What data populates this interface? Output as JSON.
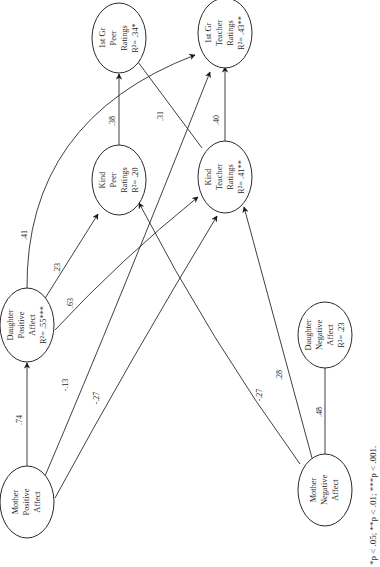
{
  "diagram": {
    "type": "path-model",
    "orientation": "rotated-90-ccw",
    "nodes": [
      {
        "id": "mpa",
        "lines": [
          "Mother",
          "Positive",
          "Affect"
        ],
        "r2": ""
      },
      {
        "id": "dpa",
        "lines": [
          "Daughter",
          "Positive",
          "Affect",
          "R²= .55***"
        ]
      },
      {
        "id": "kpr",
        "lines": [
          "Kind",
          "Peer",
          "Ratings",
          "R²= .20"
        ]
      },
      {
        "id": "ktr",
        "lines": [
          "Kind",
          "Teacher",
          "Ratings",
          "R²= .41**"
        ]
      },
      {
        "id": "gpr",
        "lines": [
          "1st Gr",
          "Peer",
          "Ratings",
          "R²= .34*"
        ]
      },
      {
        "id": "gtr",
        "lines": [
          "1st Gr",
          "Teacher",
          "Ratings",
          "R²= .43**"
        ]
      },
      {
        "id": "mna",
        "lines": [
          "Mother",
          "Negative",
          "Affect"
        ]
      },
      {
        "id": "dna",
        "lines": [
          "Daughter",
          "Negative",
          "Affect",
          "R²= .23"
        ]
      }
    ],
    "edges": [
      {
        "from": "mpa",
        "to": "dpa",
        "coef": ".74"
      },
      {
        "from": "mpa",
        "to": "gtr",
        "coef": "-.13"
      },
      {
        "from": "mpa",
        "to": "ktr",
        "coef": "-.27"
      },
      {
        "from": "dpa",
        "to": "gtr",
        "coef": ".41"
      },
      {
        "from": "dpa",
        "to": "kpr",
        "coef": ".23"
      },
      {
        "from": "dpa",
        "to": "ktr",
        "coef": ".63"
      },
      {
        "from": "kpr",
        "to": "gpr",
        "coef": ".38"
      },
      {
        "from": "ktr",
        "to": "gpr",
        "coef": ".31"
      },
      {
        "from": "ktr",
        "to": "gtr",
        "coef": ".40"
      },
      {
        "from": "mna",
        "to": "kpr",
        "coef": "-.27"
      },
      {
        "from": "mna",
        "to": "ktr",
        "coef": ".28"
      },
      {
        "from": "mna",
        "to": "dna",
        "coef": ".48"
      }
    ],
    "footnote": "*p < .05; **p < .01; ***p < .001."
  }
}
